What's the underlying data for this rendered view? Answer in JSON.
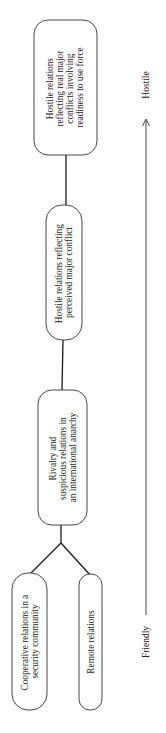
{
  "diagram": {
    "orientation": "rotated-90-ccw",
    "nodes": [
      {
        "id": "hostile-real",
        "lines": [
          "Hostile relations",
          "reflecting real major",
          "conflicts involving",
          "readiness to use force"
        ]
      },
      {
        "id": "hostile-perceived",
        "lines": [
          "Hostile relations reflecting",
          "perceived major conflict"
        ]
      },
      {
        "id": "rivalry",
        "lines": [
          "Rivalry and",
          "suspicious relations in",
          "an international anarchy"
        ]
      },
      {
        "id": "cooperative",
        "lines": [
          "Cooperative relations in a",
          "security community"
        ]
      },
      {
        "id": "remote",
        "lines": [
          "Remote relations"
        ]
      }
    ],
    "edges": [
      {
        "from": "hostile-real",
        "to": "hostile-perceived"
      },
      {
        "from": "hostile-perceived",
        "to": "rivalry"
      },
      {
        "from": "rivalry",
        "to": "cooperative"
      },
      {
        "from": "rivalry",
        "to": "remote"
      }
    ],
    "axis": {
      "start_label": "Friendly",
      "end_label": "Hostile",
      "direction": "Friendly → Hostile"
    }
  }
}
